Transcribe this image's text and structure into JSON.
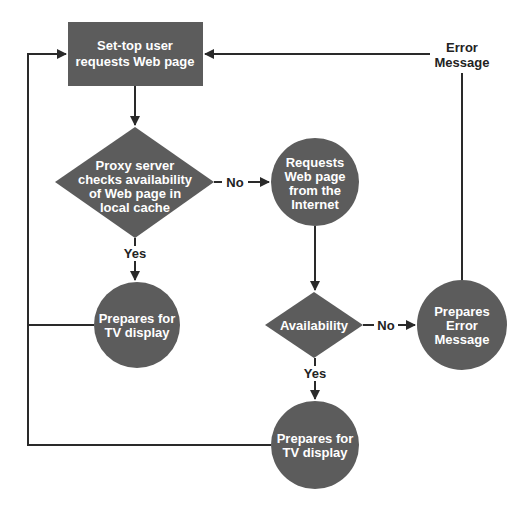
{
  "colors": {
    "shape_fill": "#5c5c5c",
    "line": "#2a2a2a",
    "background": "#ffffff"
  },
  "nodes": {
    "start": {
      "shape": "rectangle",
      "lines": [
        "Set-top user",
        "requests Web page"
      ]
    },
    "cache_check": {
      "shape": "diamond",
      "lines": [
        "Proxy server",
        "checks availability",
        "of Web page in",
        "local cache"
      ]
    },
    "request_internet": {
      "shape": "circle",
      "lines": [
        "Requests",
        "Web page",
        "from the",
        "Internet"
      ]
    },
    "prepare_tv_1": {
      "shape": "circle",
      "lines": [
        "Prepares for",
        "TV display"
      ]
    },
    "availability": {
      "shape": "diamond",
      "lines": [
        "Availability"
      ]
    },
    "prepare_error": {
      "shape": "circle",
      "lines": [
        "Prepares",
        "Error",
        "Message"
      ]
    },
    "prepare_tv_2": {
      "shape": "circle",
      "lines": [
        "Prepares for",
        "TV display"
      ]
    }
  },
  "edge_labels": {
    "cache_no": "No",
    "cache_yes": "Yes",
    "avail_no": "No",
    "avail_yes": "Yes",
    "error_return": [
      "Error",
      "Message"
    ]
  }
}
